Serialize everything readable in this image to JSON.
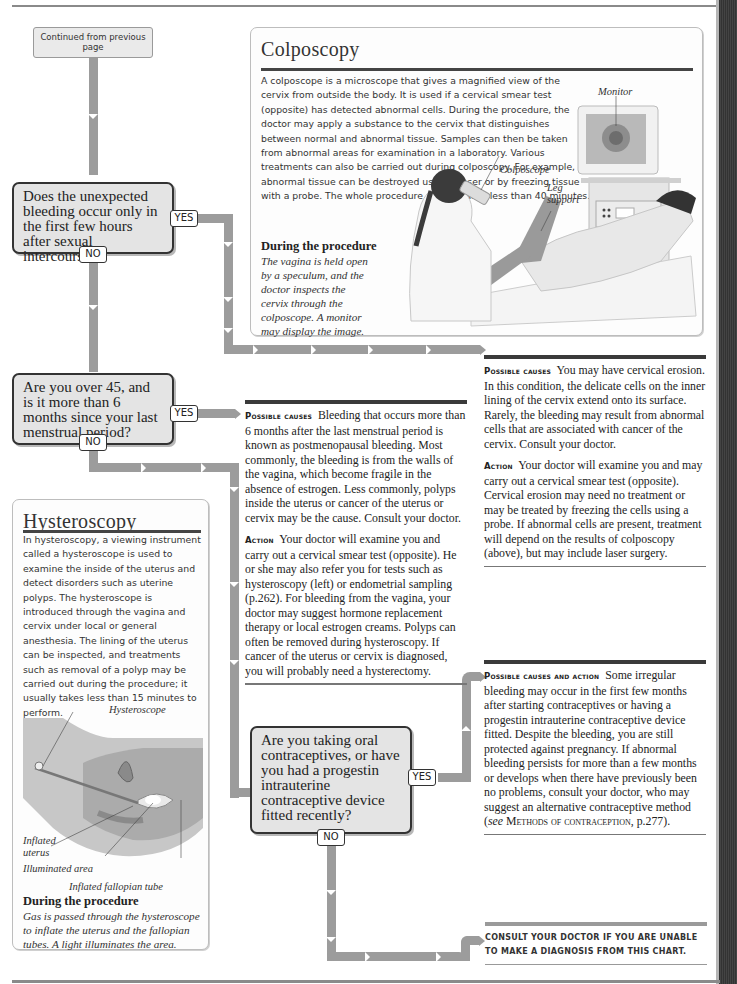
{
  "page": {
    "continued_from": "Continued from previous page"
  },
  "questions": [
    {
      "id": "q1",
      "text": "Does the unexpected bleeding occur only in the first few hours after sexual intercourse?",
      "yes": "YES",
      "no": "NO"
    },
    {
      "id": "q2",
      "text": "Are you over 45, and is it more than 6 months since your last menstrual period?",
      "yes": "YES",
      "no": "NO"
    },
    {
      "id": "q3",
      "text": "Are you taking oral contraceptives, or have you had a progestin intrauterine contraceptive device fitted recently?",
      "yes": "YES",
      "no": "NO"
    }
  ],
  "colposcopy": {
    "title": "Colposcopy",
    "body": "A colposcope is a microscope that gives a magnified view of the cervix from outside the body. It is used if a cervical smear test (opposite) has detected abnormal cells. During the procedure, the doctor may apply a substance to the cervix that distinguishes between normal and abnormal tissue. Samples can then be taken from abnormal areas for examination in a laboratory. Various treatments can also be carried out during colposcopy. For example, abnormal tissue can be destroyed using a laser or by freezing tissue with a probe. The whole procedure usually takes less than 40 minutes.",
    "procedure_heading": "During the procedure",
    "procedure_text": "The vagina is held open by a speculum, and the doctor inspects the cervix through the colposcope. A monitor may display the image.",
    "labels": {
      "monitor": "Monitor",
      "colposcope": "Colposcope",
      "leg_support_1": "Leg",
      "leg_support_2": "support"
    }
  },
  "hysteroscopy": {
    "title": "Hysteroscopy",
    "body": "In hysteroscopy, a viewing instrument called a hysteroscope is used to examine the inside of the uterus and detect disorders such as uterine polyps. The hysteroscope is introduced through the vagina and cervix under local or general anesthesia. The lining of the uterus can be inspected, and treatments such as removal of a polyp may be carried out during the procedure; it usually takes less than 15 minutes to perform.",
    "procedure_heading": "During the procedure",
    "procedure_text": "Gas is passed through the hysteroscope to inflate the uterus and the fallopian tubes. A light illuminates the area.",
    "labels": {
      "hysteroscope": "Hysteroscope",
      "inflated_uterus_1": "Inflated",
      "inflated_uterus_2": "uterus",
      "illuminated_area": "Illuminated area",
      "inflated_tube": "Inflated fallopian tube"
    }
  },
  "outcomes": {
    "cervical_erosion": {
      "causes_label": "Possible causes",
      "causes_text": "You may have cervical erosion. In this condition, the delicate cells on the inner lining of the cervix extend onto its surface. Rarely, the bleeding may result from abnormal cells that are associated with cancer of the cervix. Consult your doctor.",
      "action_label": "Action",
      "action_text": "Your doctor will examine you and may carry out a cervical smear test (opposite). Cervical erosion may need no treatment or may be treated by freezing the cells using a probe. If abnormal cells are present, treatment will depend on the results of colposcopy (above), but may include laser surgery."
    },
    "postmenopausal": {
      "causes_label": "Possible causes",
      "causes_text": "Bleeding that occurs more than 6 months after the last menstrual period is known as postmenopausal bleeding. Most commonly, the bleeding is from the walls of the vagina, which become fragile in the absence of estrogen. Less commonly, polyps inside the uterus or cancer of the uterus or cervix may be the cause. Consult your doctor.",
      "action_label": "Action",
      "action_text": "Your doctor will examine you and carry out a cervical smear test (opposite). He or she may also refer you for tests such as hysteroscopy (left) or endometrial sampling (p.262). For bleeding from the vagina, your doctor may suggest hormone replacement therapy or local estrogen creams. Polyps can often be removed during hysteroscopy. If cancer of the uterus or cervix is diagnosed, you will probably need a hysterectomy."
    },
    "contraceptives": {
      "label": "Possible causes and action",
      "text_before": "Some irregular bleeding may occur in the first few months after starting contraceptives or having a progestin intrauterine contraceptive device fitted. Despite the bleeding, you are still protected against pregnancy. If abnormal bleeding persists for more than a few months or develops when there have previously been no problems, consult your doctor, who may suggest an alternative contraceptive method (",
      "see": "see",
      "link": "Methods of contraception",
      "text_after": ", p.277)."
    },
    "consult": "Consult your doctor if you are unable to make a diagnosis from this chart."
  }
}
